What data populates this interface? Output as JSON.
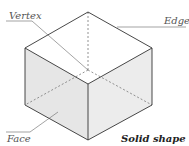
{
  "diagram": {
    "title": "Solid shape",
    "labels": {
      "vertex": "Vertex",
      "edge": "Edge",
      "face": "Face"
    },
    "colors": {
      "edge": "#333333",
      "hidden_edge": "#777777",
      "face_fill": "#e6e6e6",
      "side_fill": "#ededed",
      "top_fill": "#ffffff",
      "leader": "#666666"
    }
  }
}
